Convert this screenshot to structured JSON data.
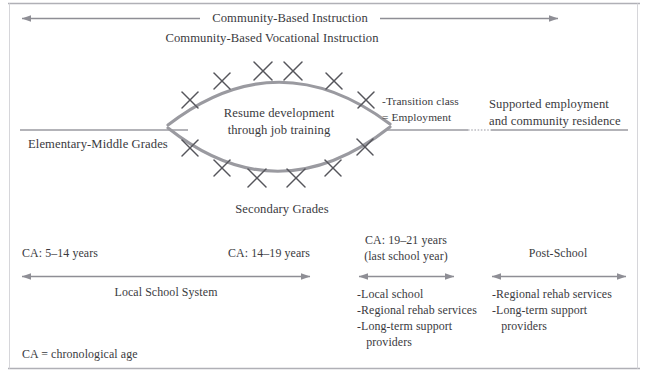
{
  "figure": {
    "title_top": "Community-Based Instruction",
    "subtitle": "Community-Based Vocational Instruction",
    "footnote": "CA = chronological age",
    "colors": {
      "text": "#3a3a3e",
      "arc": "#8e8e95",
      "rule": "#9a9aa1",
      "arrow": "#8e8e95",
      "border": "#b3b3b8",
      "x_mark": "#54545a"
    }
  },
  "arrows": {
    "community_based_instruction": {
      "label": "Community-Based Instruction",
      "x1": 20,
      "x2": 560,
      "y": 18,
      "heads": "both",
      "label_x": 290
    },
    "local_school_system": {
      "label": "Local School System",
      "x1": 20,
      "x2": 312,
      "y": 276,
      "heads": "both",
      "label_x": 166,
      "label_y": 290
    },
    "last_school_year": {
      "label": "",
      "x1": 357,
      "x2": 456,
      "y": 276,
      "heads": "both"
    },
    "post_school": {
      "label": "",
      "x1": 490,
      "x2": 628,
      "y": 276,
      "heads": "both"
    }
  },
  "lens": {
    "center_text_line1": "Resume development",
    "center_text_line2": "through job training",
    "top_curve_label": "",
    "bottom_curve_label": "Secondary Grades",
    "marks_top": [
      {
        "x": 190,
        "y": 100
      },
      {
        "x": 222,
        "y": 80
      },
      {
        "x": 263,
        "y": 71
      },
      {
        "x": 292,
        "y": 71
      },
      {
        "x": 334,
        "y": 80
      },
      {
        "x": 366,
        "y": 100
      }
    ],
    "marks_bottom": [
      {
        "x": 190,
        "y": 148
      },
      {
        "x": 222,
        "y": 168
      },
      {
        "x": 257,
        "y": 178
      },
      {
        "x": 296,
        "y": 178
      },
      {
        "x": 333,
        "y": 168
      },
      {
        "x": 365,
        "y": 147
      }
    ]
  },
  "rules": {
    "elementary_line": {
      "x1": 20,
      "x2": 188,
      "y": 130
    },
    "supported_line_a": {
      "x1": 385,
      "x2": 468,
      "y": 130
    },
    "supported_line_dotted": {
      "x1": 468,
      "x2": 490,
      "y": 130
    },
    "supported_line_b": {
      "x1": 490,
      "x2": 628,
      "y": 130
    },
    "top_border": {
      "x1": 8,
      "x2": 640,
      "y": 3
    },
    "bottom_border": {
      "x1": 8,
      "x2": 640,
      "y": 368
    },
    "left_border": {
      "x": 9,
      "y1": 3,
      "y2": 368
    },
    "right_border": {
      "x": 637,
      "y1": 3,
      "y2": 368
    }
  },
  "labels": {
    "elementary_middle_grades": "Elementary-Middle Grades",
    "secondary_grades": "Secondary Grades",
    "transition_class": "-Transition class",
    "equals_employment": "= Employment",
    "supported_employment_l1": "Supported employment",
    "supported_employment_l2": "and community residence",
    "ca_5_14": "CA: 5–14 years",
    "ca_14_19": "CA: 14–19 years",
    "ca_19_21_l1": "CA: 19–21 years",
    "ca_19_21_l2": "(last school year)",
    "post_school": "Post-School",
    "local_school_system": "Local School System"
  },
  "lists": {
    "last_school_year_services": [
      "-Local school",
      "-Regional rehab services",
      "-Long-term support",
      "   providers"
    ],
    "post_school_services": [
      "-Regional rehab services",
      "-Long-term support",
      "   providers"
    ]
  }
}
